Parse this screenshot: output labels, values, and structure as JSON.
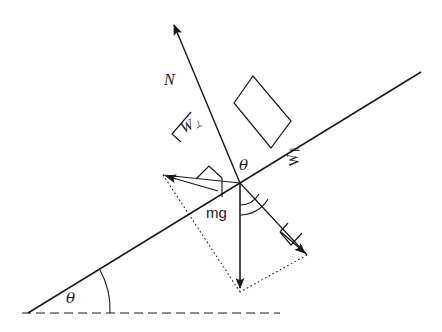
{
  "figure": {
    "kind": "physics-free-body-diagram",
    "background_color": "#ffffff",
    "line_color": "#1a1a1a",
    "text_color": "#1a1a1a"
  },
  "labels": {
    "normal_force": "N",
    "weight_perpendicular_base": "W",
    "weight_perpendicular_sub": "⊥",
    "weight_parallel_base": "W",
    "weight_parallel_sub": "∥",
    "weight": "mg",
    "incline_angle": "θ",
    "interior_angle": "θ"
  },
  "elements": {
    "incline_line": "incline-surface-line",
    "horizontal_dashed": "horizontal-reference-line",
    "block": "block-rectangle",
    "normal_arrow": "normal-force-arrow",
    "weight_arrow": "weight-arrow",
    "perp_component_arrow": "weight-perpendicular-component-arrow",
    "parallel_component_arrow": "weight-parallel-component-arrow",
    "angle_arc_base": "incline-angle-arc",
    "angle_arc_interior": "interior-angle-arc",
    "right_angle_markers": 3,
    "dotted_construction": "component-parallelogram-dotted"
  },
  "geometry": {
    "incline_angle_degrees": 28,
    "incline_start": [
      28,
      313
    ],
    "incline_end": [
      421,
      72
    ],
    "horizontal_start": [
      22,
      313
    ],
    "horizontal_end": [
      278,
      313
    ],
    "contact_point": [
      240,
      183
    ],
    "normal_tip": [
      172,
      22
    ],
    "weight_tip": [
      240,
      292
    ],
    "perp_tip": [
      164,
      174
    ],
    "parallel_tip": [
      308,
      256
    ]
  }
}
